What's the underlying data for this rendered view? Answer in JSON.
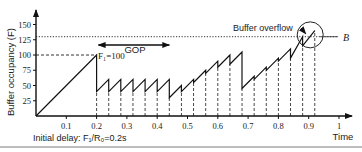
{
  "chart_data": {
    "type": "line",
    "title": "",
    "xlabel": "Time",
    "ylabel": "Buffer occupancy (F)",
    "xlim": [
      0,
      1.0
    ],
    "ylim": [
      0,
      150
    ],
    "x_ticks": [
      "0.1",
      "0.2",
      "0.3",
      "0.4",
      "0.5",
      "0.6",
      "0.7",
      "0.8",
      "0.9",
      "1"
    ],
    "y_ticks": [
      "25",
      "50",
      "75",
      "100",
      "125",
      "150"
    ],
    "grid": false,
    "series": [
      {
        "name": "Buffer occupancy",
        "x": [
          0,
          0.2,
          0.2,
          0.24,
          0.24,
          0.28,
          0.28,
          0.32,
          0.32,
          0.36,
          0.36,
          0.4,
          0.4,
          0.44,
          0.44,
          0.48,
          0.48,
          0.52,
          0.52,
          0.56,
          0.56,
          0.6,
          0.6,
          0.64,
          0.64,
          0.68,
          0.68,
          0.72,
          0.72,
          0.76,
          0.76,
          0.8,
          0.8,
          0.84,
          0.84,
          0.88,
          0.88,
          0.92
        ],
        "values": [
          0,
          100,
          40,
          60,
          40,
          60,
          40,
          60,
          40,
          60,
          40,
          60,
          40,
          60,
          30,
          50,
          40,
          60,
          55,
          75,
          70,
          90,
          80,
          100,
          85,
          105,
          45,
          65,
          60,
          80,
          75,
          95,
          90,
          110,
          95,
          130,
          115,
          140
        ]
      }
    ],
    "reference_lines": [
      {
        "label": "B",
        "y": 130,
        "style": "dotted"
      },
      {
        "label": "F1=100",
        "y": 100,
        "style": "dashed"
      }
    ],
    "annotations": [
      {
        "text": "Buffer overflow",
        "target": "circle around overflow near x=0.9"
      },
      {
        "text": "GOP",
        "type": "double-arrow",
        "x_range": [
          0.2,
          0.44
        ]
      },
      {
        "text": "F1=100",
        "at": [
          0.2,
          100
        ]
      },
      {
        "text": "Initial delay: F1/R0=0.2s",
        "position": "below x-axis"
      }
    ],
    "vertical_dashed_x": [
      0.2,
      0.24,
      0.28,
      0.32,
      0.36,
      0.4,
      0.44,
      0.48,
      0.52,
      0.56,
      0.6,
      0.64,
      0.68,
      0.72,
      0.76,
      0.8,
      0.84,
      0.88,
      0.92
    ]
  },
  "labels": {
    "ylabel": "Buffer occupancy (F)",
    "xlabel": "Time",
    "b_label": "B",
    "gop": "GOP",
    "overflow": "Buffer overflow",
    "f1": "F₁=100",
    "initial_delay": "Initial delay:  F₁/R₀=0.2s"
  }
}
